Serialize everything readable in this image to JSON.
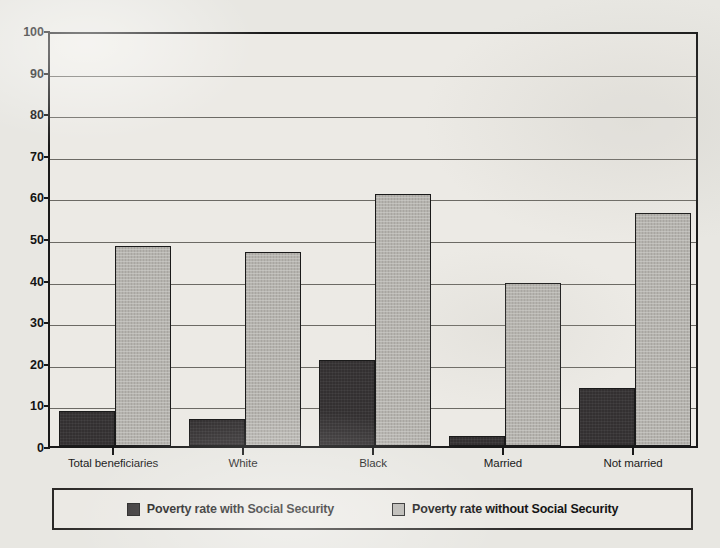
{
  "chart_data": {
    "type": "bar",
    "title": "",
    "xlabel": "",
    "ylabel": "",
    "ylim": [
      0,
      100
    ],
    "ytick_step": 10,
    "yticks": [
      100,
      90,
      80,
      70,
      60,
      50,
      40,
      30,
      20,
      10,
      0
    ],
    "grid": true,
    "grid_axis": "y",
    "legend_position": "bottom",
    "categories": [
      "Total beneficiaries",
      "White",
      "Black",
      "Married",
      "Not married"
    ],
    "series": [
      {
        "name": "Poverty rate with Social Security",
        "color": "#333031",
        "values": [
          8.4,
          6.6,
          20.7,
          2.3,
          14.0
        ]
      },
      {
        "name": "Poverty rate without Social Security",
        "color": "#b5b3ae",
        "values": [
          48.0,
          46.7,
          60.5,
          39.2,
          56.0
        ]
      }
    ]
  },
  "colors": {
    "page_background": "#e8e7e2",
    "plot_background": "#eceae5",
    "axis": "#191919",
    "gridline": "#56534e",
    "series_with": "#333031",
    "series_without": "#b5b3ae"
  }
}
